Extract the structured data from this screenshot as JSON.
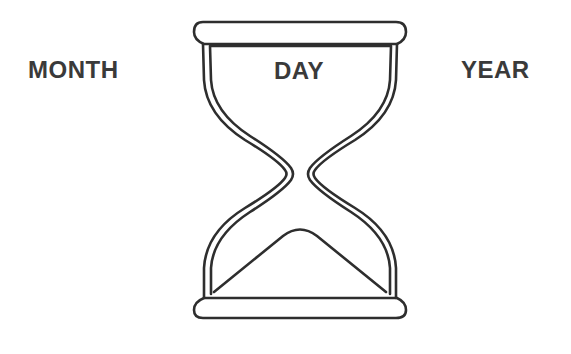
{
  "diagram": {
    "type": "hourglass-illustration",
    "labels": {
      "left": "MONTH",
      "center": "DAY",
      "right": "YEAR"
    },
    "icon": "hourglass-icon",
    "colors": {
      "stroke": "#2e2e2e",
      "text": "#3a3a3a",
      "background": "#ffffff"
    }
  }
}
